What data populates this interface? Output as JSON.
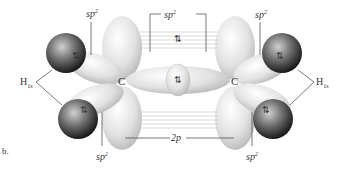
{
  "diagram": {
    "labels": {
      "sp2_top_left": {
        "base": "sp",
        "sup": "2"
      },
      "sp2_top_center": {
        "base": "sp",
        "sup": "2"
      },
      "sp2_top_right": {
        "base": "sp",
        "sup": "2"
      },
      "sp2_bottom_left": {
        "base": "sp",
        "sup": "2"
      },
      "sp2_bottom_right": {
        "base": "sp",
        "sup": "2"
      },
      "h1s_left": {
        "base": "H",
        "sub": "1s"
      },
      "h1s_right": {
        "base": "H",
        "sub": "1s"
      },
      "carbon_left": "C",
      "carbon_right": "C",
      "p_orbital": "2p",
      "panel_letter": "b."
    },
    "electron_pair_symbol": "⇅"
  }
}
